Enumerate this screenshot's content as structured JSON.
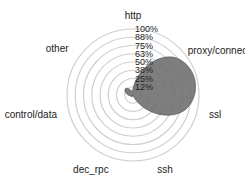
{
  "chart_data": {
    "type": "radar",
    "title": "",
    "categories": [
      "http",
      "proxy/connect",
      "ssl",
      "ssh",
      "dec_rpc",
      "control/data",
      "other"
    ],
    "series": [
      {
        "name": "traffic",
        "values": [
          10,
          88,
          85,
          5,
          3,
          5,
          15
        ]
      }
    ],
    "radial_ticks": [
      "12%",
      "25%",
      "38%",
      "50%",
      "63%",
      "75%",
      "88%",
      "100%"
    ],
    "rlim": [
      0,
      100
    ],
    "grid": true,
    "legend": "none",
    "fill_color": "#6f6f6f"
  }
}
